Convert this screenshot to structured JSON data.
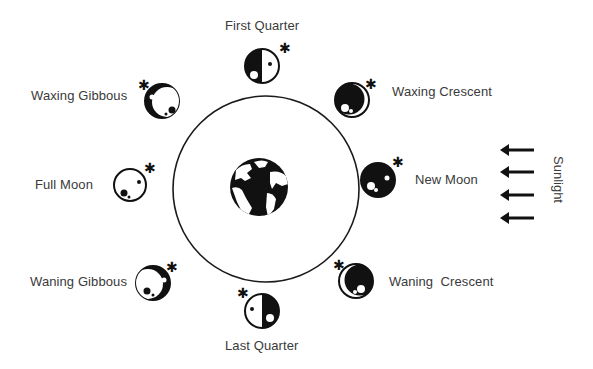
{
  "diagram": {
    "center": {
      "label": "Earth",
      "icon": "globe-icon"
    },
    "orbit": {
      "shape": "circle"
    },
    "phases": [
      {
        "id": "first-quarter",
        "label": "First Quarter"
      },
      {
        "id": "waxing-crescent",
        "label": "Waxing Crescent"
      },
      {
        "id": "new-moon",
        "label": "New Moon"
      },
      {
        "id": "waning-crescent",
        "label": "Waning  Crescent"
      },
      {
        "id": "last-quarter",
        "label": "Last Quarter"
      },
      {
        "id": "waning-gibbous",
        "label": "Waning Gibbous"
      },
      {
        "id": "full-moon",
        "label": "Full Moon"
      },
      {
        "id": "waxing-gibbous",
        "label": "Waxing Gibbous"
      }
    ],
    "sunlight": {
      "label": "Sunlight",
      "arrow_count": 4,
      "direction": "left"
    },
    "colors": {
      "ink": "#111111",
      "text": "#3a3a3a",
      "background": "#ffffff"
    }
  }
}
